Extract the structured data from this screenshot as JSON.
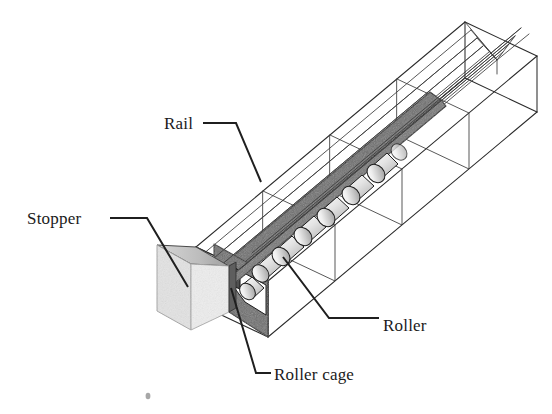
{
  "figure": {
    "type": "technical-line-diagram",
    "background_color": "#ffffff",
    "line_color": "#2b2b2b",
    "leader_color": "#1f1f1f",
    "stopper_fill": "#e3e3e3",
    "stopper_top_fill": "#bdbdbd",
    "cage_fill": "#6e6e6e",
    "cage_dark_fill": "#4a4a4a",
    "roller_fill": "#e8e8e8",
    "roller_shade_fill": "#b9b9b9",
    "labels": [
      {
        "id": "rail",
        "text": "Rail",
        "x": 164,
        "y": 129,
        "anchor": "start"
      },
      {
        "id": "stopper",
        "text": "Stopper",
        "x": 27,
        "y": 224,
        "anchor": "start"
      },
      {
        "id": "roller",
        "text": "Roller",
        "x": 383,
        "y": 331,
        "anchor": "start"
      },
      {
        "id": "roller-cage",
        "text": "Roller cage",
        "x": 274,
        "y": 380,
        "anchor": "start"
      }
    ],
    "leaders": [
      {
        "id": "rail-leader",
        "points": "203,123 236,123 261,182"
      },
      {
        "id": "stopper-leader",
        "points": "110,218 147,218 188,287"
      },
      {
        "id": "roller-leader",
        "points": "283,257 329,318 379,318"
      },
      {
        "id": "roller-cage-leader",
        "points": "231,288 256,373 271,373"
      }
    ]
  },
  "geometry": {
    "rail_segments": 4,
    "roller_count": 7,
    "rail_axis_angle_deg": -38,
    "notes": "Wireframe square-section rail running lower-left to upper-right with V-groove raceway, roller cage holding alternating crossed cylindrical rollers, and a solid stopper block at the near end."
  }
}
